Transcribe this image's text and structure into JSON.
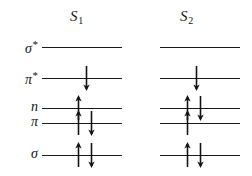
{
  "figure": {
    "type": "molecular-orbital-energy-level-diagram",
    "background_color": "#ffffff",
    "line_color": "#1a1a1a",
    "text_color": "#121212"
  },
  "columns": [
    {
      "id": "s1",
      "label": "S",
      "subscript": "1",
      "x_left": 42,
      "x_right": 122
    },
    {
      "id": "s2",
      "label": "S",
      "subscript": "2",
      "x_left": 160,
      "x_right": 240
    }
  ],
  "orbitals": [
    {
      "id": "sigma-star",
      "label": "σ",
      "superscript": "*",
      "y": 47
    },
    {
      "id": "pi-star",
      "label": "π",
      "superscript": "*",
      "y": 78
    },
    {
      "id": "n",
      "label": "n",
      "superscript": "",
      "y": 108
    },
    {
      "id": "pi",
      "label": "π",
      "superscript": "",
      "y": 123
    },
    {
      "id": "sigma",
      "label": "σ",
      "superscript": "",
      "y": 155
    }
  ],
  "occupancy": {
    "s1": {
      "sigma-star": [],
      "pi-star": [
        "down"
      ],
      "n": [
        "up"
      ],
      "pi": [
        "up",
        "down"
      ],
      "sigma": [
        "up",
        "down"
      ]
    },
    "s2": {
      "sigma-star": [],
      "pi-star": [
        "down"
      ],
      "n": [
        "up",
        "down"
      ],
      "pi": [
        "up"
      ],
      "sigma": [
        "up",
        "down"
      ]
    }
  },
  "arrow_positions": {
    "s1": {
      "up_x": 78,
      "down_x": 91,
      "single_up_x": 78,
      "single_down_x": 86
    },
    "s2": {
      "up_x": 187,
      "down_x": 200,
      "single_up_x": 187,
      "single_down_x": 196
    }
  },
  "label_x": 8
}
